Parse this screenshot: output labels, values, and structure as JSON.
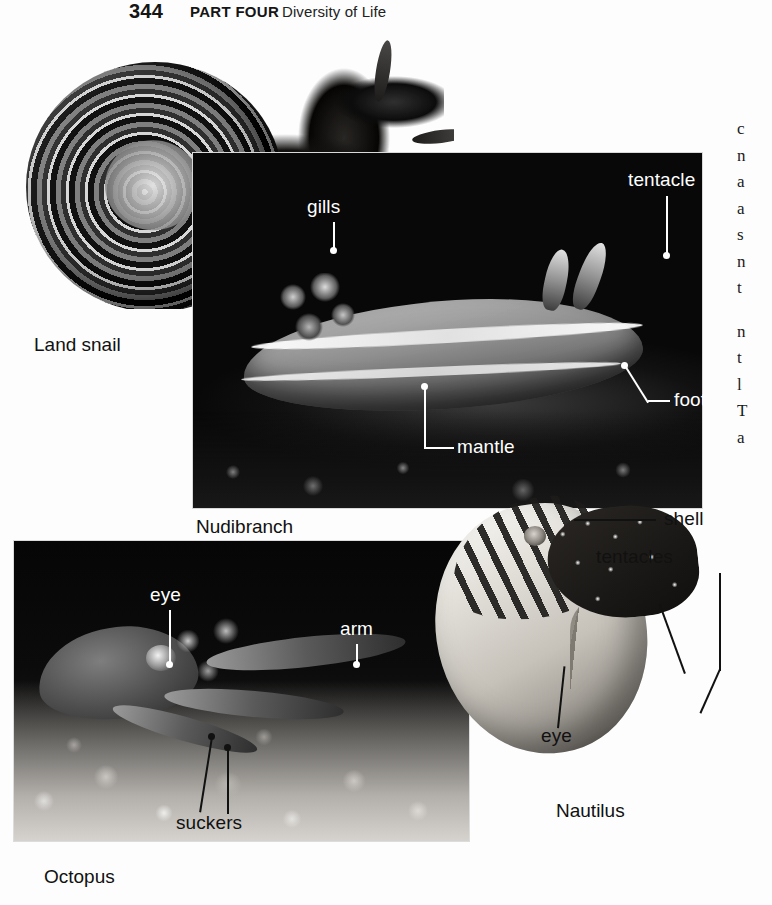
{
  "page": {
    "number": "344",
    "part": "PART FOUR",
    "section_title": "Diversity of Life",
    "background_color": "#fdfdfd",
    "text_color": "#111111",
    "label_light_color": "#ffffff"
  },
  "figure": {
    "photos": [
      {
        "id": "land-snail",
        "caption": "Land snail",
        "labels": []
      },
      {
        "id": "nudibranch",
        "caption": "Nudibranch",
        "labels": [
          "foot",
          "gills",
          "tentacle",
          "mantle",
          "foot"
        ]
      },
      {
        "id": "octopus",
        "caption": "Octopus",
        "labels": [
          "eye",
          "arm",
          "suckers"
        ]
      },
      {
        "id": "nautilus",
        "caption": "Nautilus",
        "labels": [
          "shell",
          "tentacles",
          "eye"
        ]
      }
    ],
    "callouts": {
      "snail_foot": "foot",
      "nudibranch_gills": "gills",
      "nudibranch_tentacle": "tentacle",
      "nudibranch_mantle": "mantle",
      "nudibranch_foot": "foot",
      "octopus_eye": "eye",
      "octopus_arm": "arm",
      "octopus_suckers": "suckers",
      "nautilus_shell": "shell",
      "nautilus_tentacles": "tentacles",
      "nautilus_eye": "eye"
    },
    "captions": {
      "land_snail": "Land snail",
      "nudibranch": "Nudibranch",
      "octopus": "Octopus",
      "nautilus": "Nautilus"
    }
  },
  "body_column": {
    "note": "body text column clipped by the right page edge; only the first letters of each line are visible",
    "paragraph_1": "c\nn\na\na\ns\nn\nt",
    "paragraph_2": "n\nt\nl\nT\na\nt"
  }
}
